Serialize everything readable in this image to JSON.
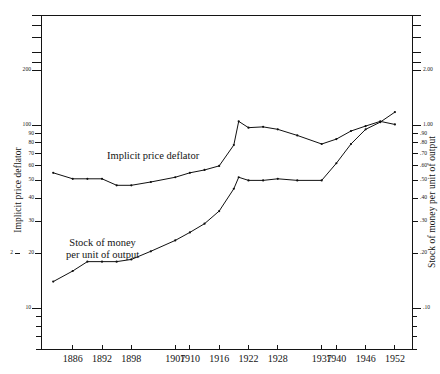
{
  "chart_data": {
    "type": "line",
    "title": "",
    "xlabel": "",
    "ylabel_left": "Implicit price deflator",
    "ylabel_right": "Stock of money per unit of output",
    "scale": "log",
    "grid": false,
    "legend": "inline-annotations",
    "categories": [
      "1886",
      "1892",
      "1898",
      "1907",
      "1910",
      "1916",
      "1922",
      "1928",
      "1937",
      "1940",
      "1946",
      "1952"
    ],
    "x_tick_labels": [
      "1886",
      "1892",
      "1898",
      "1907",
      "1910",
      "1916",
      "1922",
      "1928",
      "1937",
      "1940",
      "1946",
      "1952"
    ],
    "y_left_ticks": [
      "200",
      "100",
      "90",
      "80",
      "70",
      "60",
      "50",
      "40",
      "30",
      "20",
      "10"
    ],
    "y_left_tick_values": [
      200,
      100,
      90,
      80,
      70,
      60,
      50,
      40,
      30,
      20,
      10
    ],
    "y_left_extra_tick": "2",
    "y_right_ticks": [
      "2.00",
      "1.00",
      ".90",
      ".80",
      ".70",
      ".60",
      ".50",
      ".40",
      ".30",
      ".20",
      ".10"
    ],
    "y_right_tick_values": [
      2.0,
      1.0,
      0.9,
      0.8,
      0.7,
      0.6,
      0.5,
      0.4,
      0.3,
      0.2,
      0.1
    ],
    "ylim_left": [
      6,
      400
    ],
    "ylim_right": [
      0.06,
      4.0
    ],
    "series": [
      {
        "name": "Implicit price deflator",
        "axis": "left",
        "x": [
          1882,
          1886,
          1889,
          1892,
          1895,
          1898,
          1902,
          1907,
          1910,
          1913,
          1916,
          1919,
          1920,
          1922,
          1925,
          1928,
          1932,
          1937,
          1940,
          1943,
          1946,
          1949,
          1952
        ],
        "values": [
          55,
          51,
          51,
          51,
          47,
          47,
          49,
          52,
          55,
          57,
          60,
          78,
          105,
          97,
          98,
          95,
          88,
          79,
          84,
          93,
          99,
          105,
          101
        ]
      },
      {
        "name": "Stock of money per unit of output",
        "axis": "left",
        "x": [
          1882,
          1886,
          1889,
          1892,
          1895,
          1898,
          1902,
          1907,
          1910,
          1913,
          1916,
          1919,
          1920,
          1922,
          1925,
          1928,
          1932,
          1937,
          1940,
          1943,
          1946,
          1949,
          1952
        ],
        "values": [
          14,
          16,
          18,
          18,
          18,
          18.5,
          20.5,
          23.5,
          26,
          29,
          34,
          45,
          52,
          50,
          50,
          51,
          50,
          50,
          62,
          79,
          95,
          104,
          118
        ]
      }
    ],
    "annotations": [
      {
        "text": "Implicit price deflator",
        "x_frac": 0.34,
        "y_value": 118
      },
      {
        "text": "Stock of money per unit of output",
        "x_frac": 0.2,
        "y_value": 30
      }
    ]
  },
  "labels": {
    "left_axis_title": "Implicit price deflator",
    "right_axis_title": "Stock of money per unit of output",
    "deflator_annotation": "Implicit price deflator",
    "money_annotation_line1": "Stock of money",
    "money_annotation_line2": "per unit of output"
  },
  "colors": {
    "ink": "#141414",
    "line": "#101010",
    "background": "#ffffff"
  }
}
